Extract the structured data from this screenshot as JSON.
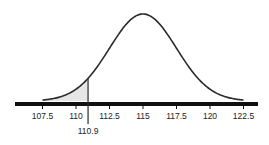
{
  "chart_data": {
    "type": "area",
    "title": "",
    "xlabel": "",
    "ylabel": "",
    "distribution": "normal",
    "mean": 115,
    "sd": 2.5,
    "xlim": [
      105.5,
      124.5
    ],
    "tick_labels": [
      "107.5",
      "110",
      "112.5",
      "115",
      "117.5",
      "120",
      "122.5"
    ],
    "tick_values": [
      107.5,
      110,
      112.5,
      115,
      117.5,
      120,
      122.5
    ],
    "shaded_region": {
      "from": 107.5,
      "to": 110.9,
      "label": "110.9"
    },
    "marker": {
      "value": 110.9,
      "label": "110.9"
    },
    "grid": false,
    "legend": false
  },
  "colors": {
    "curve": "#2a2a2a",
    "axis": "#111111",
    "shade": "#e6e6e6"
  }
}
